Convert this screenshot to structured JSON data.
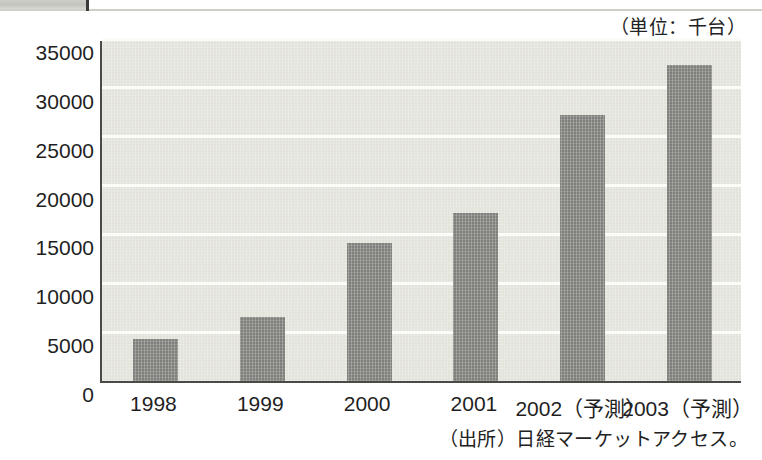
{
  "chart_data": {
    "type": "bar",
    "title": "",
    "subtitle": "",
    "unit_caption": "（単位：千台）",
    "source_note": "（出所）日経マーケットアクセス。",
    "xlabel": "",
    "ylabel": "",
    "ylim": [
      0,
      35000
    ],
    "ytick_step": 5000,
    "grid": true,
    "legend": "none",
    "categories": [
      "1998",
      "1999",
      "2000",
      "2001",
      "2002（予測）",
      "2003（予測）"
    ],
    "values": [
      4300,
      6600,
      14100,
      17200,
      27200,
      32300
    ],
    "ytick_labels": [
      "0",
      "5000",
      "10000",
      "15000",
      "20000",
      "25000",
      "30000",
      "35000"
    ],
    "ytick_values": [
      0,
      5000,
      10000,
      15000,
      20000,
      25000,
      30000,
      35000
    ],
    "bar_color": "#7f7f7b",
    "plot_background": "#e3e3dc",
    "gridline_color": "#fbfbf7",
    "axis_color": "#4a4a46"
  }
}
